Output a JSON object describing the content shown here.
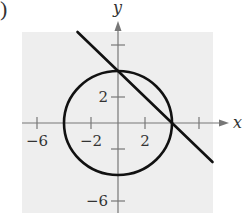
{
  "figure": {
    "part_label": ")",
    "background_color": "#eeeeee",
    "curve_color": "#111111",
    "axis_color": "#777777"
  },
  "chart_data": {
    "type": "line",
    "title": "",
    "xlabel": "x",
    "ylabel": "y",
    "xlim": [
      -7.2,
      7.2
    ],
    "ylim": [
      -6.9,
      7
    ],
    "grid": false,
    "x_ticks": [
      -6,
      -2,
      2,
      6
    ],
    "x_tick_labels": [
      "−6",
      "−2",
      "2",
      ""
    ],
    "y_ticks": [
      6,
      2,
      -2,
      -6
    ],
    "y_tick_labels": [
      "",
      "2",
      "",
      "−6"
    ],
    "series": [
      {
        "name": "circle",
        "shape": "circle",
        "equation": "x^2 + y^2 = 16",
        "center": [
          0,
          0
        ],
        "radius": 4
      },
      {
        "name": "line",
        "shape": "line",
        "equation": "y = -x + 4",
        "x": [
          -3,
          7
        ],
        "y": [
          7,
          -3
        ]
      }
    ],
    "intersections": [
      [
        0,
        4
      ],
      [
        4,
        0
      ]
    ]
  }
}
